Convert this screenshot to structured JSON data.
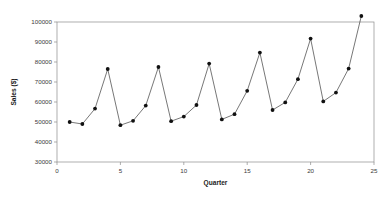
{
  "chart_data": {
    "type": "line",
    "title": "",
    "xlabel": "Quarter",
    "ylabel": "Sales ($)",
    "xlim": [
      0,
      25
    ],
    "ylim": [
      30000,
      100000
    ],
    "xticks": [
      0,
      5,
      10,
      15,
      20,
      25
    ],
    "xtick_labels": [
      "0",
      "5",
      "10",
      "15",
      "20",
      "25"
    ],
    "yticks": [
      30000,
      40000,
      50000,
      60000,
      70000,
      80000,
      90000,
      100000
    ],
    "ytick_labels": [
      "30000",
      "40000",
      "50000",
      "60000",
      "70000",
      "80000",
      "90000",
      "100000"
    ],
    "grid": false,
    "legend": null,
    "markers": "filled-circle",
    "line_color": "#4a4a4a",
    "marker_color": "#111111",
    "x": [
      1,
      2,
      3,
      4,
      5,
      6,
      7,
      8,
      9,
      10,
      11,
      12,
      13,
      14,
      15,
      16,
      17,
      18,
      19,
      20,
      21,
      22,
      23,
      24
    ],
    "values": [
      50000,
      49000,
      56700,
      76500,
      48400,
      50600,
      58200,
      77500,
      50400,
      52700,
      58500,
      79200,
      51300,
      53900,
      65600,
      84700,
      56000,
      59800,
      71400,
      91700,
      60300,
      64700,
      76700,
      103000
    ],
    "series": [
      {
        "name": "Sales ($)",
        "values": [
          50000,
          49000,
          56700,
          76500,
          48400,
          50600,
          58200,
          77500,
          50400,
          52700,
          58500,
          79200,
          51300,
          53900,
          65600,
          84700,
          56000,
          59800,
          71400,
          91700,
          60300,
          64700,
          76700,
          103000
        ]
      }
    ]
  }
}
